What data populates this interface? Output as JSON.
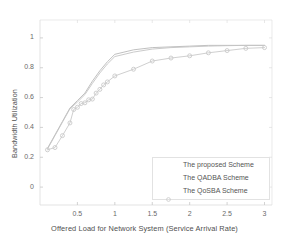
{
  "chart_data": {
    "type": "line",
    "title": "",
    "xlabel": "Offered Load for Network System (Service Arrival Rate)",
    "ylabel": "Bandwidth Utilization",
    "xlim": [
      0,
      3.1
    ],
    "ylim": [
      -0.12,
      1.12
    ],
    "xticks": [
      "0.5",
      "1",
      "1.5",
      "2",
      "2.5",
      "3"
    ],
    "xtick_values": [
      0.5,
      1,
      1.5,
      2,
      2.5,
      3
    ],
    "yticks": [
      "0",
      "0.2",
      "0.4",
      "0.6",
      "0.8",
      "1"
    ],
    "ytick_values": [
      0,
      0.2,
      0.4,
      0.6,
      0.8,
      1
    ],
    "grid": false,
    "legend_position": "lower right",
    "series": [
      {
        "name": "The proposed Scheme",
        "color": "#b9b9b9",
        "marker": "none",
        "x": [
          0.1,
          0.2,
          0.3,
          0.4,
          0.5,
          0.6,
          0.7,
          0.8,
          0.9,
          1.0,
          1.25,
          1.5,
          1.75,
          2.0,
          2.25,
          2.5,
          2.75,
          3.0
        ],
        "y": [
          0.26,
          0.35,
          0.44,
          0.53,
          0.58,
          0.63,
          0.71,
          0.78,
          0.84,
          0.89,
          0.92,
          0.935,
          0.94,
          0.945,
          0.95,
          0.95,
          0.95,
          0.95
        ]
      },
      {
        "name": "The QADBA Scheme",
        "color": "#c4c4c4",
        "marker": "none",
        "x": [
          0.1,
          0.2,
          0.3,
          0.4,
          0.5,
          0.6,
          0.7,
          0.8,
          0.9,
          1.0,
          1.25,
          1.5,
          1.75,
          2.0,
          2.25,
          2.5,
          2.75,
          3.0
        ],
        "y": [
          0.255,
          0.345,
          0.435,
          0.525,
          0.57,
          0.62,
          0.695,
          0.765,
          0.825,
          0.875,
          0.905,
          0.925,
          0.935,
          0.94,
          0.945,
          0.948,
          0.95,
          0.95
        ]
      },
      {
        "name": "The QoSBA Scheme",
        "color": "#c9c9c9",
        "marker": "circle",
        "x": [
          0.1,
          0.2,
          0.3,
          0.4,
          0.45,
          0.5,
          0.55,
          0.6,
          0.65,
          0.7,
          0.75,
          0.8,
          0.85,
          0.9,
          1.0,
          1.25,
          1.5,
          1.75,
          2.0,
          2.25,
          2.5,
          2.75,
          3.0
        ],
        "y": [
          0.25,
          0.265,
          0.345,
          0.43,
          0.52,
          0.535,
          0.56,
          0.565,
          0.585,
          0.59,
          0.63,
          0.655,
          0.685,
          0.705,
          0.745,
          0.79,
          0.845,
          0.865,
          0.88,
          0.9,
          0.915,
          0.93,
          0.935
        ]
      }
    ]
  },
  "legend": {
    "items": [
      {
        "label": "The proposed Scheme"
      },
      {
        "label": "The QADBA Scheme"
      },
      {
        "label": "The QoSBA Scheme"
      }
    ]
  }
}
